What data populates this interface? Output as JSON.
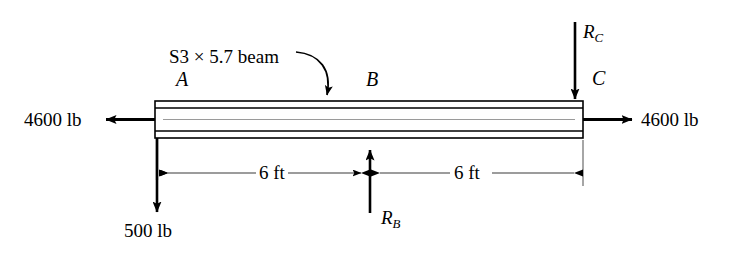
{
  "figure": {
    "type": "engineering-free-body-diagram"
  },
  "beam": {
    "label": "S3 × 5.7 beam",
    "nodes": {
      "a": "A",
      "b": "B",
      "c": "C"
    }
  },
  "loads": {
    "axial_left": "4600 lb",
    "axial_right": "4600 lb",
    "point_a_vertical": "500 lb"
  },
  "reactions": {
    "b": {
      "symbol": "R",
      "subscript": "B"
    },
    "c": {
      "symbol": "R",
      "subscript": "C"
    }
  },
  "dimensions": {
    "left_span": "6 ft",
    "right_span": "6 ft"
  },
  "colors": {
    "stroke": "#000000",
    "background": "#ffffff",
    "beam_inner_line": "#9a9a9a",
    "dimension_line": "#4a4a4a"
  }
}
